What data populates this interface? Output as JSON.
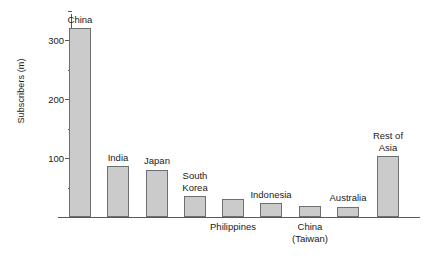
{
  "chart_data": {
    "type": "bar",
    "title": "",
    "xlabel": "",
    "ylabel": "Subscribers (m)",
    "ylim": [
      0,
      350
    ],
    "grid": false,
    "legend": false,
    "y_ticks_major": [
      100,
      200,
      300
    ],
    "y_tick_labels": [
      "100",
      "200",
      "300"
    ],
    "y_ticks_minor": [
      50,
      150,
      250,
      350
    ],
    "categories": [
      "China",
      "India",
      "Japan",
      "South\nKorea",
      "Philippines",
      "Indonesia",
      "China\n(Taiwan)",
      "Australia",
      "Rest of\nAsia"
    ],
    "values": [
      320,
      86,
      80,
      35,
      30,
      23,
      18,
      17,
      103
    ],
    "label_positions": [
      "above",
      "above",
      "above",
      "above",
      "below",
      "above",
      "below",
      "above",
      "above"
    ],
    "bar_fill_color": "#cbcbcb",
    "bar_border_color": "#6e6f71",
    "axis_color": "#58595b",
    "text_color": "#1a1a1a"
  },
  "axis": {
    "y_title": "Subscribers (m)"
  }
}
